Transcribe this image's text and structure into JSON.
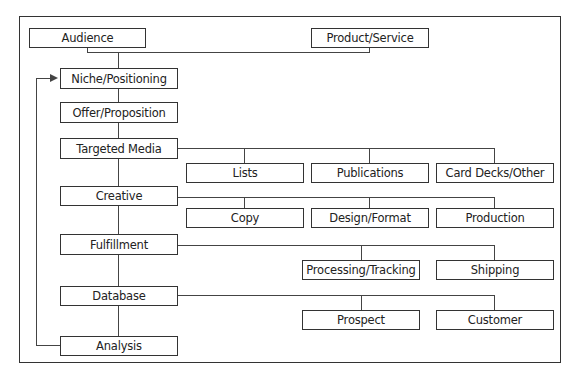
{
  "diagram": {
    "title": "",
    "top": {
      "audience": "Audience",
      "product_service": "Product/Service"
    },
    "main_column": [
      "Niche/Positioning",
      "Offer/Proposition",
      "Targeted Media",
      "Creative",
      "Fulfillment",
      "Database",
      "Analysis"
    ],
    "branches": {
      "targeted_media": [
        "Lists",
        "Publications",
        "Card Decks/Other"
      ],
      "creative": [
        "Copy",
        "Design/Format",
        "Production"
      ],
      "fulfillment": [
        "Processing/Tracking",
        "Shipping"
      ],
      "database": [
        "Prospect",
        "Customer"
      ]
    },
    "feedback_loop": {
      "from": "Analysis",
      "to": "Niche/Positioning"
    },
    "colors": {
      "line": "#333333",
      "box_fill": "#ffffff",
      "text": "#222222"
    }
  }
}
